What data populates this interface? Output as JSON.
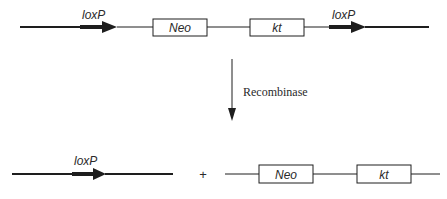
{
  "diagram": {
    "colors": {
      "line": "#1e1e1e",
      "box_fill": "#ffffff",
      "text": "#2a2a2a"
    },
    "top_construct": {
      "left_site_label": "loxP",
      "gene1_label": "Neo",
      "gene2_label": "kt",
      "right_site_label": "loxP"
    },
    "reaction": {
      "enzyme_label": "Recombinase"
    },
    "products": {
      "left_product_site_label": "loxP",
      "plus_sign": "+",
      "excised_gene1_label": "Neo",
      "excised_gene2_label": "kt"
    }
  }
}
